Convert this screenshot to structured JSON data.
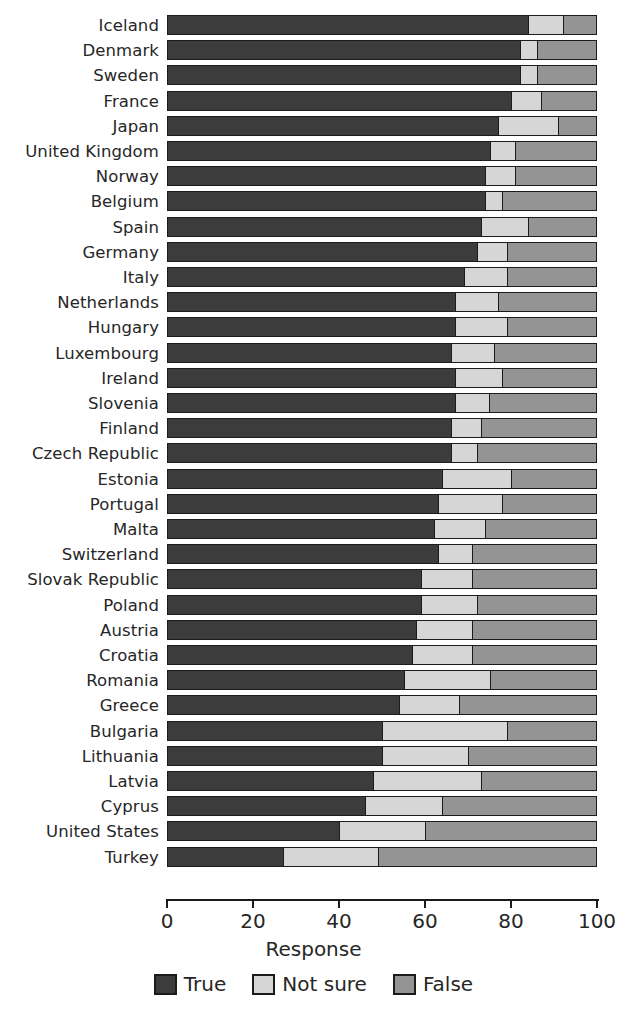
{
  "chart_data": {
    "type": "bar",
    "orientation": "horizontal",
    "stacked": true,
    "title": "",
    "xlabel": "Response",
    "ylabel": "",
    "xlim": [
      0,
      100
    ],
    "xticks": [
      0,
      20,
      40,
      60,
      80,
      100
    ],
    "xtick_labels": [
      "0",
      "20",
      "40",
      "60",
      "80",
      "100"
    ],
    "grid": false,
    "legend_position": "bottom",
    "legend": [
      "True",
      "Not sure",
      "False"
    ],
    "series": [
      {
        "name": "True",
        "color": "#3c3c3c"
      },
      {
        "name": "Not sure",
        "color": "#d6d6d6"
      },
      {
        "name": "False",
        "color": "#949494"
      }
    ],
    "categories": [
      "Iceland",
      "Denmark",
      "Sweden",
      "France",
      "Japan",
      "United Kingdom",
      "Norway",
      "Belgium",
      "Spain",
      "Germany",
      "Italy",
      "Netherlands",
      "Hungary",
      "Luxembourg",
      "Ireland",
      "Slovenia",
      "Finland",
      "Czech Republic",
      "Estonia",
      "Portugal",
      "Malta",
      "Switzerland",
      "Slovak Republic",
      "Poland",
      "Austria",
      "Croatia",
      "Romania",
      "Greece",
      "Bulgaria",
      "Lithuania",
      "Latvia",
      "Cyprus",
      "United States",
      "Turkey"
    ],
    "rows": [
      {
        "category": "Iceland",
        "True": 84,
        "Not sure": 8,
        "False": 8
      },
      {
        "category": "Denmark",
        "True": 82,
        "Not sure": 4,
        "False": 14
      },
      {
        "category": "Sweden",
        "True": 82,
        "Not sure": 4,
        "False": 14
      },
      {
        "category": "France",
        "True": 80,
        "Not sure": 7,
        "False": 13
      },
      {
        "category": "Japan",
        "True": 77,
        "Not sure": 14,
        "False": 9
      },
      {
        "category": "United Kingdom",
        "True": 75,
        "Not sure": 6,
        "False": 19
      },
      {
        "category": "Norway",
        "True": 74,
        "Not sure": 7,
        "False": 19
      },
      {
        "category": "Belgium",
        "True": 74,
        "Not sure": 4,
        "False": 22
      },
      {
        "category": "Spain",
        "True": 73,
        "Not sure": 11,
        "False": 16
      },
      {
        "category": "Germany",
        "True": 72,
        "Not sure": 7,
        "False": 21
      },
      {
        "category": "Italy",
        "True": 69,
        "Not sure": 10,
        "False": 21
      },
      {
        "category": "Netherlands",
        "True": 67,
        "Not sure": 10,
        "False": 23
      },
      {
        "category": "Hungary",
        "True": 67,
        "Not sure": 12,
        "False": 21
      },
      {
        "category": "Luxembourg",
        "True": 66,
        "Not sure": 10,
        "False": 24
      },
      {
        "category": "Ireland",
        "True": 67,
        "Not sure": 11,
        "False": 22
      },
      {
        "category": "Slovenia",
        "True": 67,
        "Not sure": 8,
        "False": 25
      },
      {
        "category": "Finland",
        "True": 66,
        "Not sure": 7,
        "False": 27
      },
      {
        "category": "Czech Republic",
        "True": 66,
        "Not sure": 6,
        "False": 28
      },
      {
        "category": "Estonia",
        "True": 64,
        "Not sure": 16,
        "False": 20
      },
      {
        "category": "Portugal",
        "True": 63,
        "Not sure": 15,
        "False": 22
      },
      {
        "category": "Malta",
        "True": 62,
        "Not sure": 12,
        "False": 26
      },
      {
        "category": "Switzerland",
        "True": 63,
        "Not sure": 8,
        "False": 29
      },
      {
        "category": "Slovak Republic",
        "True": 59,
        "Not sure": 12,
        "False": 29
      },
      {
        "category": "Poland",
        "True": 59,
        "Not sure": 13,
        "False": 28
      },
      {
        "category": "Austria",
        "True": 58,
        "Not sure": 13,
        "False": 29
      },
      {
        "category": "Croatia",
        "True": 57,
        "Not sure": 14,
        "False": 29
      },
      {
        "category": "Romania",
        "True": 55,
        "Not sure": 20,
        "False": 25
      },
      {
        "category": "Greece",
        "True": 54,
        "Not sure": 14,
        "False": 32
      },
      {
        "category": "Bulgaria",
        "True": 50,
        "Not sure": 29,
        "False": 21
      },
      {
        "category": "Lithuania",
        "True": 50,
        "Not sure": 20,
        "False": 30
      },
      {
        "category": "Latvia",
        "True": 48,
        "Not sure": 25,
        "False": 27
      },
      {
        "category": "Cyprus",
        "True": 46,
        "Not sure": 18,
        "False": 36
      },
      {
        "category": "United States",
        "True": 40,
        "Not sure": 20,
        "False": 40
      },
      {
        "category": "Turkey",
        "True": 27,
        "Not sure": 22,
        "False": 51
      }
    ]
  },
  "axis": {
    "xlabel": "Response",
    "ticks": [
      "0",
      "20",
      "40",
      "60",
      "80",
      "100"
    ]
  },
  "legend": {
    "items": [
      {
        "label": "True",
        "color": "#3c3c3c",
        "icon": "swatch-icon"
      },
      {
        "label": "Not sure",
        "color": "#d6d6d6",
        "icon": "swatch-icon"
      },
      {
        "label": "False",
        "color": "#949494",
        "icon": "swatch-icon"
      }
    ]
  }
}
